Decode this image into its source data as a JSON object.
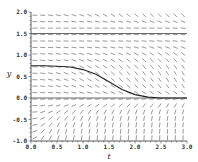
{
  "chart_data": {
    "type": "line",
    "subtype": "direction-field",
    "title": "",
    "xlabel": "t",
    "ylabel": "y",
    "xlim": [
      0.0,
      3.0
    ],
    "ylim": [
      -1.0,
      2.0
    ],
    "x_ticks": [
      "0.0",
      "0.5",
      "1.0",
      "1.5",
      "2.0",
      "2.5",
      "3.0"
    ],
    "y_ticks": [
      "2.0",
      "1.5",
      "1.0",
      "0.5",
      "0.0",
      "-0.5",
      "-1.0"
    ],
    "grid": false,
    "legend": null,
    "equilibrium_lines": [
      1.5,
      0.0
    ],
    "series": [
      {
        "name": "solution curve",
        "x": [
          0.0,
          0.25,
          0.5,
          0.75,
          1.0,
          1.25,
          1.5,
          1.75,
          2.0,
          2.25,
          2.5,
          2.75,
          3.0
        ],
        "y": [
          0.75,
          0.75,
          0.74,
          0.72,
          0.66,
          0.55,
          0.38,
          0.2,
          0.08,
          0.02,
          0.0,
          0.0,
          0.0
        ]
      }
    ],
    "slope_field": {
      "rows": 20,
      "cols": 20,
      "description": "slopes negative above y=1.5 and between 0 and 1.5, positive below 0; steepness increases with t"
    }
  },
  "colors": {
    "axis": "#333333",
    "field": "#555555",
    "curve": "#222222"
  }
}
